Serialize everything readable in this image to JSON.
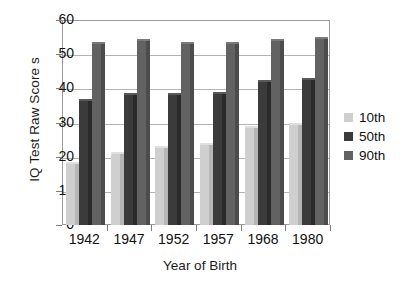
{
  "chart_data": {
    "type": "bar",
    "title": "",
    "xlabel": "Year of Birth",
    "ylabel": "IQ Test Raw Score s",
    "categories": [
      "1942",
      "1947",
      "1952",
      "1957",
      "1968",
      "1980"
    ],
    "series": [
      {
        "name": "10th",
        "color": "#cfcfcf",
        "values": [
          18.5,
          21.5,
          23,
          24,
          29,
          30
        ]
      },
      {
        "name": "50th",
        "color": "#3b3b3b",
        "values": [
          37,
          38.5,
          38.5,
          39,
          42.5,
          43
        ]
      },
      {
        "name": "90th",
        "color": "#626262",
        "values": [
          53.5,
          54.5,
          53.5,
          53.5,
          54.5,
          55
        ]
      }
    ],
    "ylim": [
      0,
      60
    ],
    "yticks": [
      0,
      10,
      20,
      30,
      40,
      50,
      60
    ],
    "ytick_labels": [
      "0",
      "10",
      "20",
      "30",
      "40",
      "50",
      "60"
    ],
    "grid": "horizontal",
    "legend_position": "right"
  }
}
